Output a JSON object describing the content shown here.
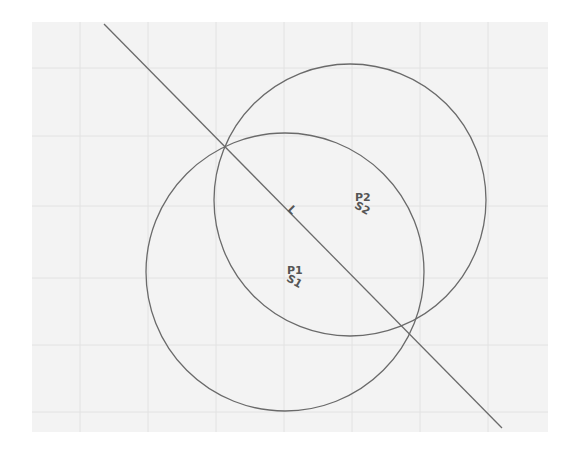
{
  "canvas": {
    "background": "#ffffff",
    "plot_area": {
      "x": 32,
      "y": 22,
      "width": 516,
      "height": 410,
      "fill": "#f3f3f3"
    },
    "grid": {
      "color": "#e2e2e2",
      "vertical_x": [
        80,
        148,
        216,
        284,
        352,
        420,
        488
      ],
      "horizontal_y": [
        68,
        136,
        206,
        278,
        345,
        412
      ]
    },
    "stroke_color": "#6a6a6a"
  },
  "line": {
    "name": "L",
    "label": "L",
    "x1": 104,
    "y1": 24,
    "x2": 502,
    "y2": 428,
    "label_x": 287,
    "label_y": 210
  },
  "circles": [
    {
      "name": "S1",
      "center_label": "P1",
      "circle_label": "S1",
      "cx": 285,
      "cy": 272,
      "r": 139,
      "label_x": 287,
      "label_y": 276
    },
    {
      "name": "S2",
      "center_label": "P2",
      "circle_label": "S2",
      "cx": 350,
      "cy": 200,
      "r": 136,
      "label_x": 355,
      "label_y": 203
    }
  ]
}
